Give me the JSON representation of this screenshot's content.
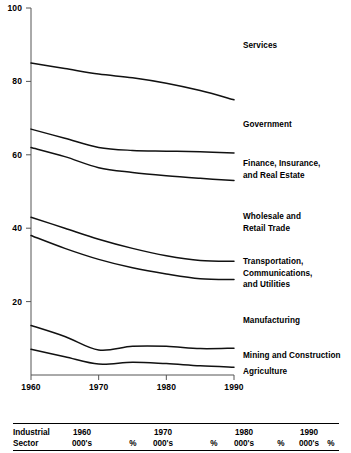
{
  "chart_data": {
    "type": "line",
    "title": "",
    "xlabel": "",
    "ylabel": "",
    "xlim": [
      1960,
      1990
    ],
    "ylim": [
      0,
      100
    ],
    "grid": false,
    "legend_position": "right-inline-labels",
    "x": [
      1960,
      1965,
      1970,
      1975,
      1980,
      1985,
      1990
    ],
    "yticks": [
      "0",
      "20",
      "40",
      "60",
      "80",
      "100"
    ],
    "ytick_values": [
      0,
      20,
      40,
      60,
      80,
      100
    ],
    "xticks": [
      "1960",
      "1970",
      "1980",
      "1990"
    ],
    "xtick_values": [
      1960,
      1970,
      1980,
      1990
    ],
    "series": [
      {
        "name": "Services",
        "label": "Services",
        "values": [
          85.0,
          83.5,
          82.0,
          81.0,
          79.5,
          77.5,
          75.0
        ]
      },
      {
        "name": "Government",
        "label": "Government",
        "values": [
          67.0,
          64.5,
          62.0,
          61.2,
          61.0,
          60.8,
          60.5
        ]
      },
      {
        "name": "Finance, Insurance, and Real Estate",
        "label": "Finance, Insurance,\nand Real Estate",
        "values": [
          62.0,
          59.5,
          56.5,
          55.2,
          54.3,
          53.6,
          53.0
        ]
      },
      {
        "name": "Wholesale and Retail Trade",
        "label": "Wholesale and\nRetail Trade",
        "values": [
          43.0,
          40.0,
          37.0,
          34.5,
          32.5,
          31.2,
          31.0
        ]
      },
      {
        "name": "Transportation, Communications, and Utilities",
        "label": "Transportation,\nCommunications,\nand Utilities",
        "values": [
          38.0,
          34.5,
          31.5,
          29.2,
          27.5,
          26.2,
          26.0
        ]
      },
      {
        "name": "Manufacturing",
        "label": "Manufacturing",
        "values": [
          13.5,
          10.5,
          6.8,
          7.8,
          7.8,
          7.2,
          7.3
        ]
      },
      {
        "name": "Mining and Construction",
        "label": "Mining and Construction",
        "values": [
          7.0,
          5.0,
          3.0,
          3.5,
          3.1,
          2.5,
          2.1
        ]
      },
      {
        "name": "Agriculture",
        "label": "Agriculture",
        "values": [
          0.0,
          0.0,
          0.0,
          0.0,
          0.0,
          0.0,
          0.0
        ]
      }
    ]
  },
  "table": {
    "col_label_line1": "Industrial",
    "col_label_line2": "Sector",
    "year_groups": [
      {
        "year": "1960",
        "thousands": "000's",
        "percent": "%"
      },
      {
        "year": "1970",
        "thousands": "000's",
        "percent": "%"
      },
      {
        "year": "1980",
        "thousands": "000's",
        "percent": "%"
      },
      {
        "year": "1990",
        "thousands": "000's",
        "percent": "%"
      }
    ]
  },
  "style": {
    "line_color": "#111111",
    "axis_color": "#555555",
    "text_color": "#000000",
    "background": "#ffffff"
  }
}
